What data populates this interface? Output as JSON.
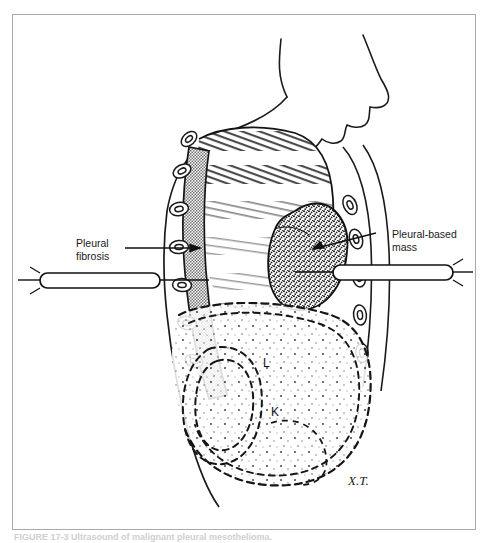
{
  "figure": {
    "caption": "FIGURE 17-3   Ultrasound of malignant pleural mesothelioma.",
    "signature": "X.T.",
    "view_description": "Lateral sagittal view of thorax and upper abdomen"
  },
  "labels": {
    "fibrosis": "Pleural\nfibrosis",
    "mass": "Pleural-based\nmass"
  },
  "organ_markers": {
    "liver": "L",
    "kidney": "K"
  },
  "colors": {
    "frame": "#a9a9a9",
    "ink": "#111111",
    "pleural_gray": "#8e8e8e",
    "lung_hatch": "#6f6f6f",
    "mass_stipple": "#2a2a2a",
    "caption_gray": "#cfcfcf",
    "paper": "#ffffff"
  },
  "elements": {
    "transducer_left": "left-transducer-probe",
    "transducer_right": "right-transducer-probe",
    "ribs": "rib-cross-sections",
    "diaphragm": "diaphragm-dashed-outline",
    "lung_field": "lung-field-hatching"
  }
}
